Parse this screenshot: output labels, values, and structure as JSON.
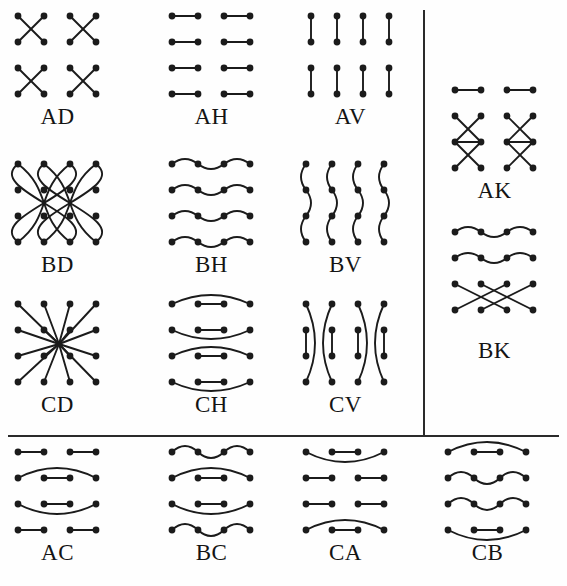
{
  "figure": {
    "kind": "plate-of-link-patterns",
    "background": "#fefefe",
    "ink": "#1b1b1b",
    "dot_radius": 3.4,
    "stroke_width": 1.9,
    "grid": {
      "cols": 4,
      "rows": 4,
      "dx": 26,
      "dy": 26
    },
    "dividers": [
      {
        "name": "vertical-divider",
        "orient": "vert",
        "x": 423,
        "y": 10,
        "length": 425
      },
      {
        "name": "horizontal-divider",
        "orient": "horiz",
        "x": 8,
        "y": 435,
        "length": 551
      }
    ],
    "panels": [
      {
        "id": "AD",
        "label": "AD",
        "x": 18,
        "y": 16,
        "cap_y": 104,
        "pattern": "diagonal-pairs-2x2",
        "description": "four independent X crossings in 2x2 blocks"
      },
      {
        "id": "AH",
        "label": "AH",
        "x": 172,
        "y": 16,
        "cap_y": 104,
        "pattern": "horizontal-pairs",
        "description": "horizontal segments joining adjacent column pairs"
      },
      {
        "id": "AV",
        "label": "AV",
        "x": 311,
        "y": 16,
        "cap_y": 104,
        "pattern": "vertical-pairs",
        "description": "vertical segments joining adjacent row pairs"
      },
      {
        "id": "AK",
        "label": "AK",
        "x": 455,
        "y": 90,
        "cap_y": 178,
        "pattern": "k-hourglass",
        "description": "top row paired horizontally, lower three rows form hourglass with horizontal middle"
      },
      {
        "id": "BD",
        "label": "BD",
        "x": 18,
        "y": 164,
        "cap_y": 252,
        "pattern": "long-curved-diagonals",
        "description": "long curved diagonal strands sweeping across the whole 4x4 array"
      },
      {
        "id": "BH",
        "label": "BH",
        "x": 172,
        "y": 164,
        "cap_y": 252,
        "pattern": "horizontal-serpentine",
        "description": "serpentine waves alternating above and below each row"
      },
      {
        "id": "BV",
        "label": "BV",
        "x": 306,
        "y": 164,
        "cap_y": 252,
        "pattern": "vertical-serpentine",
        "description": "serpentine S-waves running down each column"
      },
      {
        "id": "BK",
        "label": "BK",
        "x": 455,
        "y": 232,
        "cap_y": 338,
        "pattern": "k-waves-and-cross",
        "description": "two serpentine rows above, long crossing diagonals below"
      },
      {
        "id": "CD",
        "label": "CD",
        "x": 18,
        "y": 304,
        "cap_y": 392,
        "pattern": "star-to-center",
        "description": "every dot joined by a straight line toward a common centre"
      },
      {
        "id": "CH",
        "label": "CH",
        "x": 172,
        "y": 304,
        "cap_y": 392,
        "pattern": "nested-horizontal-arcs",
        "description": "outer horizontal arc enclosing an inner middle segment"
      },
      {
        "id": "CV",
        "label": "CV",
        "x": 306,
        "y": 304,
        "cap_y": 392,
        "pattern": "nested-vertical-arcs",
        "description": "outer vertical arc enclosing an inner middle segment"
      },
      {
        "id": "AC",
        "label": "AC",
        "x": 18,
        "y": 452,
        "cap_y": 540,
        "pattern": "pairs-and-arcs",
        "description": "outer rows paired, inner rows arc outside a middle segment"
      },
      {
        "id": "BC",
        "label": "BC",
        "x": 172,
        "y": 452,
        "cap_y": 540,
        "pattern": "waves-and-arcs",
        "description": "serpentine outer rows with arc-enclosed middle rows"
      },
      {
        "id": "CA",
        "label": "CA",
        "x": 306,
        "y": 452,
        "cap_y": 540,
        "pattern": "arcs-and-pairs",
        "description": "arc-enclosed outer rows with plain paired middle rows"
      },
      {
        "id": "CB",
        "label": "CB",
        "x": 448,
        "y": 452,
        "cap_y": 540,
        "pattern": "arcs-and-waves",
        "description": "arc rows alternating with serpentine wave rows"
      }
    ]
  }
}
